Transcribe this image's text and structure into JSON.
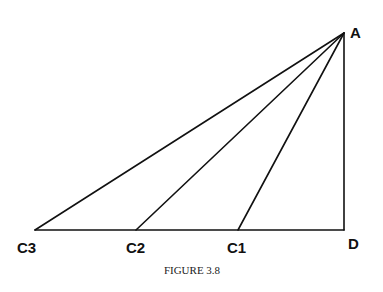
{
  "figure": {
    "caption": "FIGURE 3.8",
    "colors": {
      "line": "#111111",
      "background": "#ffffff"
    },
    "points": {
      "A": {
        "label": "A",
        "x": 344,
        "y": 33
      },
      "D": {
        "label": "D",
        "x": 344,
        "y": 230
      },
      "C1": {
        "label": "C1",
        "x": 238,
        "y": 230
      },
      "C2": {
        "label": "C2",
        "x": 136,
        "y": 230
      },
      "C3": {
        "label": "C3",
        "x": 35,
        "y": 230
      }
    },
    "segments": [
      [
        "A",
        "D"
      ],
      [
        "C3",
        "D"
      ],
      [
        "A",
        "C1"
      ],
      [
        "A",
        "C2"
      ],
      [
        "A",
        "C3"
      ]
    ]
  }
}
